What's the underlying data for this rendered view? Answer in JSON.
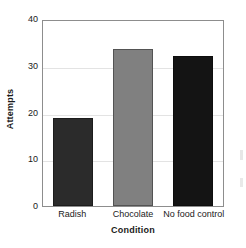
{
  "chart_data": {
    "type": "bar",
    "title": "",
    "subtitle": "",
    "xlabel": "Condition",
    "ylabel": "Attempts",
    "categories": [
      "Radish",
      "Chocolate",
      "No food control"
    ],
    "values": [
      19,
      34,
      32.5
    ],
    "series": [
      {
        "name": "Attempts",
        "values": [
          19,
          34,
          32.5
        ]
      }
    ],
    "bar_colors": [
      "#2b2b2b",
      "#808080",
      "#141414"
    ],
    "ylim": [
      0,
      40
    ],
    "yticks": [
      0,
      10,
      20,
      30,
      40
    ],
    "ytick_labels": [
      "0",
      "10",
      "20",
      "30",
      "40"
    ],
    "grid": true,
    "grid_axis": "y",
    "legend": false,
    "legend_position": "none",
    "frame_color": "#8d8d8d",
    "grid_color": "#e3e3e3",
    "background": "#ffffff"
  }
}
